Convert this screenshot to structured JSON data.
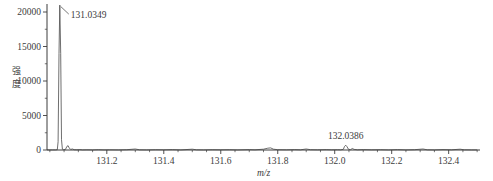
{
  "chart_data": {
    "type": "line",
    "title": "",
    "xlabel": "m/z",
    "ylabel": "强度",
    "xlim": [
      130.99,
      132.51
    ],
    "ylim": [
      0,
      21300
    ],
    "x_major_ticks": [
      131.2,
      131.4,
      131.6,
      131.8,
      132.0,
      132.2,
      132.4
    ],
    "x_tick_labels": [
      "131.2",
      "131.4",
      "131.6",
      "131.8",
      "132.0",
      "132.2",
      "132.4"
    ],
    "x_minor_tick_step": 0.05,
    "y_major_ticks": [
      0,
      5000,
      10000,
      15000,
      20000
    ],
    "y_tick_labels": [
      "0",
      "5000",
      "10000",
      "15000",
      "20000"
    ],
    "y_minor_ticks": [
      2500,
      7500,
      12500,
      17500
    ],
    "grid": false,
    "legend": "none",
    "line_color": "#4a4a4a",
    "axis_color": "#3c3c3c",
    "peaks": [
      {
        "mz": 131.0349,
        "intensity": 21000,
        "label": "131.0349",
        "label_anchor": "right"
      },
      {
        "mz": 132.0386,
        "intensity": 700,
        "label": "132.0386",
        "label_anchor": "above"
      }
    ],
    "profile": [
      [
        130.99,
        10
      ],
      [
        131.0,
        15
      ],
      [
        131.01,
        10
      ],
      [
        131.02,
        20
      ],
      [
        131.026,
        40
      ],
      [
        131.029,
        1200
      ],
      [
        131.032,
        14000
      ],
      [
        131.0349,
        21000
      ],
      [
        131.038,
        14000
      ],
      [
        131.041,
        1500
      ],
      [
        131.044,
        120
      ],
      [
        131.048,
        60
      ],
      [
        131.055,
        90
      ],
      [
        131.06,
        520
      ],
      [
        131.064,
        620
      ],
      [
        131.068,
        300
      ],
      [
        131.073,
        90
      ],
      [
        131.08,
        150
      ],
      [
        131.085,
        40
      ],
      [
        131.095,
        25
      ],
      [
        131.105,
        60
      ],
      [
        131.115,
        20
      ],
      [
        131.13,
        35
      ],
      [
        131.15,
        15
      ],
      [
        131.17,
        40
      ],
      [
        131.19,
        20
      ],
      [
        131.21,
        30
      ],
      [
        131.24,
        15
      ],
      [
        131.27,
        45
      ],
      [
        131.3,
        140
      ],
      [
        131.315,
        30
      ],
      [
        131.34,
        20
      ],
      [
        131.37,
        50
      ],
      [
        131.4,
        25
      ],
      [
        131.43,
        60
      ],
      [
        131.46,
        20
      ],
      [
        131.5,
        110
      ],
      [
        131.515,
        30
      ],
      [
        131.54,
        20
      ],
      [
        131.57,
        45
      ],
      [
        131.6,
        25
      ],
      [
        131.63,
        40
      ],
      [
        131.66,
        20
      ],
      [
        131.7,
        60
      ],
      [
        131.72,
        25
      ],
      [
        131.75,
        120
      ],
      [
        131.765,
        260
      ],
      [
        131.775,
        300
      ],
      [
        131.785,
        120
      ],
      [
        131.8,
        40
      ],
      [
        131.83,
        25
      ],
      [
        131.86,
        60
      ],
      [
        131.88,
        30
      ],
      [
        131.9,
        140
      ],
      [
        131.915,
        40
      ],
      [
        131.94,
        25
      ],
      [
        131.97,
        60
      ],
      [
        131.99,
        30
      ],
      [
        132.01,
        50
      ],
      [
        132.02,
        25
      ],
      [
        132.03,
        90
      ],
      [
        132.034,
        480
      ],
      [
        132.0386,
        700
      ],
      [
        132.043,
        480
      ],
      [
        132.048,
        110
      ],
      [
        132.055,
        40
      ],
      [
        132.062,
        220
      ],
      [
        132.068,
        80
      ],
      [
        132.08,
        30
      ],
      [
        132.1,
        60
      ],
      [
        132.13,
        25
      ],
      [
        132.16,
        45
      ],
      [
        132.19,
        20
      ],
      [
        132.22,
        55
      ],
      [
        132.25,
        20
      ],
      [
        132.28,
        40
      ],
      [
        132.31,
        140
      ],
      [
        132.325,
        30
      ],
      [
        132.35,
        20
      ],
      [
        132.38,
        60
      ],
      [
        132.41,
        25
      ],
      [
        132.44,
        120
      ],
      [
        132.455,
        30
      ],
      [
        132.48,
        20
      ],
      [
        132.5,
        15
      ]
    ]
  }
}
